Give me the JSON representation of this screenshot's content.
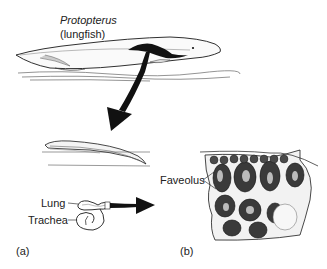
{
  "figure": {
    "panel_a": {
      "species_name": "Protopterus",
      "common_name": "(lungfish)",
      "lung_label": "Lung",
      "trachea_label": "Trachea",
      "panel_label": "(a)"
    },
    "panel_b": {
      "faveolus_label": "Faveolus",
      "panel_label": "(b)"
    },
    "colors": {
      "ink": "#1a1a1a",
      "background": "#ffffff",
      "shading": "#888888"
    }
  }
}
